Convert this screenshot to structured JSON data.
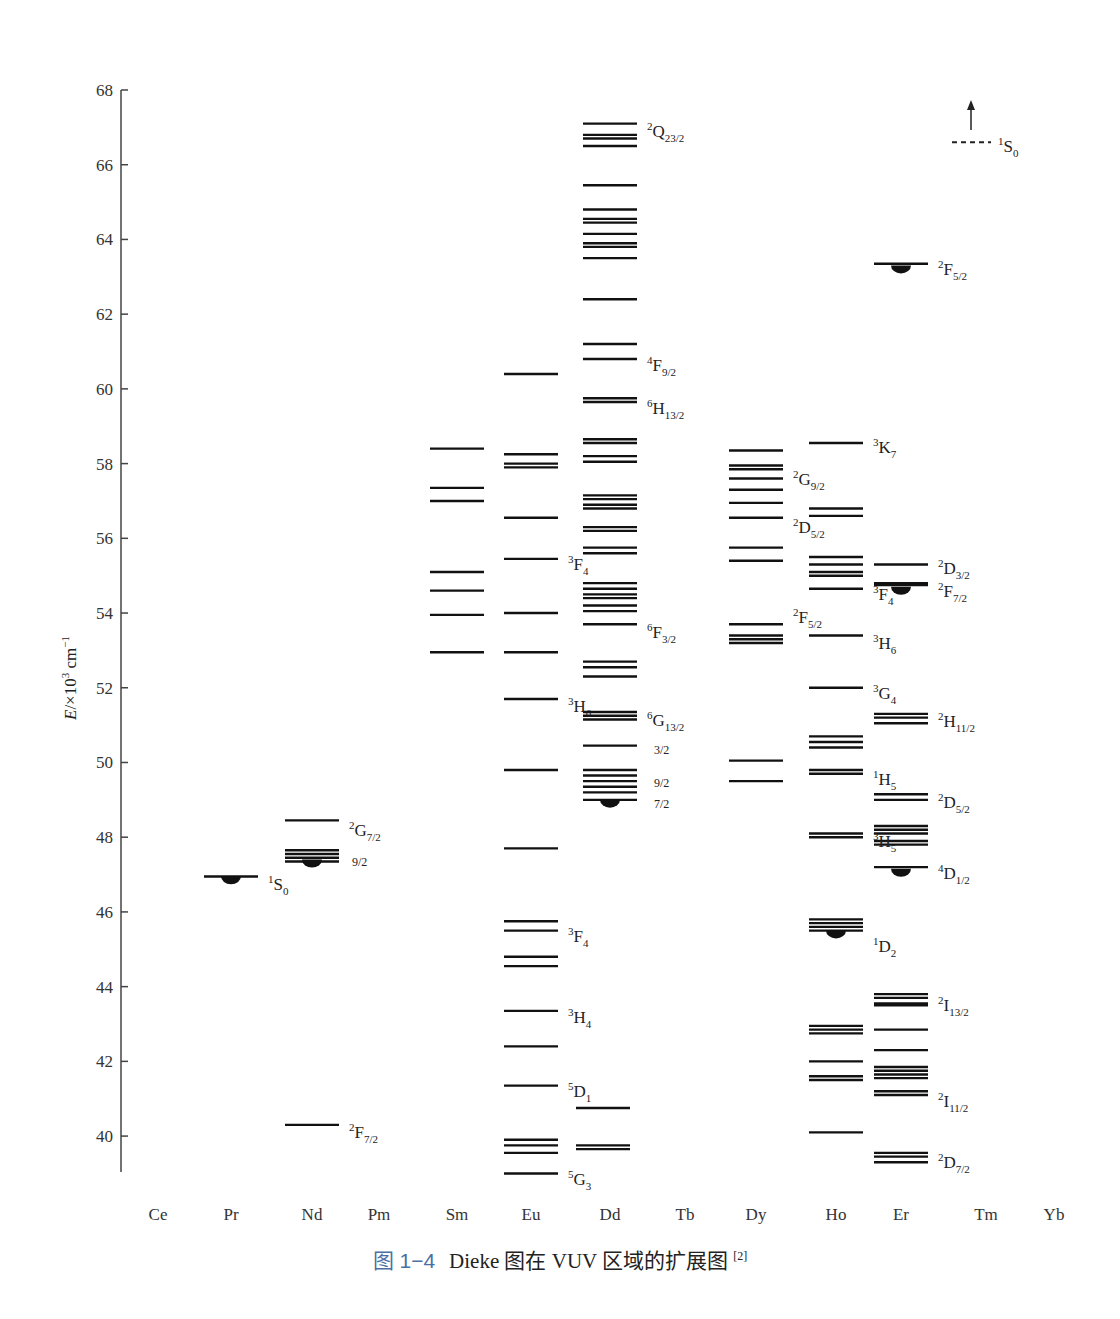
{
  "chart_data": {
    "type": "energy-level-diagram",
    "title": "",
    "ylabel": "E/×10³ cm⁻¹",
    "xlabel": "",
    "ylim": [
      39,
      68
    ],
    "yticks": [
      40,
      42,
      44,
      46,
      48,
      50,
      52,
      54,
      56,
      58,
      60,
      62,
      64,
      66,
      68
    ],
    "grid": false,
    "categories": [
      "Ce",
      "Pr",
      "Nd",
      "Pm",
      "Sm",
      "Eu",
      "Dd",
      "Tb",
      "Dy",
      "Ho",
      "Er",
      "Tm",
      "Yb"
    ],
    "category_x": [
      158,
      231,
      312,
      379,
      457,
      531,
      610,
      685,
      756,
      836,
      901,
      986,
      1054
    ],
    "series": [
      {
        "name": "Ce",
        "levels": []
      },
      {
        "name": "Pr",
        "levels": [
          46.95
        ],
        "bulbs": [
          46.9
        ],
        "labels": [
          {
            "text": "1S0",
            "sup": "1",
            "main": "S",
            "sub": "0",
            "E": 46.75
          }
        ]
      },
      {
        "name": "Nd",
        "levels": [
          48.45,
          47.65,
          47.55,
          47.45,
          47.35,
          40.3
        ],
        "bulbs": [
          47.35
        ],
        "labels": [
          {
            "text": "2G7/2",
            "sup": "2",
            "main": "G",
            "sub": "7/2",
            "E": 48.2
          },
          {
            "text": "9/2",
            "plain": "9/2",
            "E": 47.4,
            "dx": 40
          },
          {
            "text": "2F7/2",
            "sup": "2",
            "main": "F",
            "sub": "7/2",
            "E": 40.1
          }
        ]
      },
      {
        "name": "Pm",
        "levels": []
      },
      {
        "name": "Sm",
        "levels": [
          58.4,
          57.35,
          57.0,
          55.1,
          54.6,
          53.95,
          52.95
        ],
        "labels": []
      },
      {
        "name": "Eu",
        "levels": [
          60.4,
          58.25,
          58.0,
          57.9,
          56.55,
          55.45,
          54.0,
          52.95,
          51.7,
          49.8,
          47.7,
          45.75,
          45.5,
          44.8,
          44.55,
          43.35,
          42.4,
          41.35,
          39.9,
          39.75,
          39.55,
          39.0
        ],
        "labels": [
          {
            "text": "3F4",
            "sup": "3",
            "main": "F",
            "sub": "4",
            "E": 55.3
          },
          {
            "text": "3H6",
            "sup": "3",
            "main": "H",
            "sub": "6",
            "E": 51.5
          },
          {
            "text": "3F4",
            "sup": "3",
            "main": "F",
            "sub": "4",
            "E": 45.35
          },
          {
            "text": "3H4",
            "sup": "3",
            "main": "H",
            "sub": "4",
            "E": 43.2
          },
          {
            "text": "5D1",
            "sup": "5",
            "main": "D",
            "sub": "1",
            "E": 41.2
          },
          {
            "text": "5G3",
            "sup": "5",
            "main": "G",
            "sub": "3",
            "E": 38.85
          }
        ]
      },
      {
        "name": "Dd",
        "levels": [
          67.1,
          66.8,
          66.7,
          66.5,
          65.45,
          64.8,
          64.55,
          64.45,
          64.15,
          63.9,
          63.8,
          63.5,
          62.4,
          61.2,
          60.8,
          59.75,
          59.65,
          58.65,
          58.55,
          58.2,
          58.05,
          57.15,
          57.05,
          56.9,
          56.8,
          56.3,
          56.2,
          55.75,
          55.6,
          54.8,
          54.65,
          54.5,
          54.4,
          54.2,
          54.05,
          53.7,
          52.7,
          52.55,
          52.3,
          51.35,
          51.25,
          51.15,
          50.45,
          49.8,
          49.65,
          49.5,
          49.35,
          49.2,
          49.0
        ],
        "bulbs": [
          48.95
        ],
        "labels": [
          {
            "text": "2Q23/2",
            "sup": "2",
            "main": "Q",
            "sub": "23/2",
            "E": 66.9
          },
          {
            "text": "4F9/2",
            "sup": "4",
            "main": "F",
            "sub": "9/2",
            "E": 60.65
          },
          {
            "text": "6H13/2",
            "sup": "6",
            "main": "H",
            "sub": "13/2",
            "E": 59.5
          },
          {
            "text": "6F3/2",
            "sup": "6",
            "main": "F",
            "sub": "3/2",
            "E": 53.5
          },
          {
            "text": "6G13/2",
            "sup": "6",
            "main": "G",
            "sub": "13/2",
            "E": 51.15
          },
          {
            "text": "3/2",
            "plain": "3/2",
            "E": 50.4,
            "dx": 44
          },
          {
            "text": "9/2",
            "plain": "9/2",
            "E": 49.5,
            "dx": 44
          },
          {
            "text": "7/2",
            "plain": "7/2",
            "E": 48.95,
            "dx": 44
          }
        ]
      },
      {
        "name": "Dd-low",
        "x": 603,
        "levels": [
          40.75,
          39.75,
          39.65
        ],
        "labels": []
      },
      {
        "name": "Tb",
        "levels": []
      },
      {
        "name": "Dy",
        "levels": [
          58.35,
          57.95,
          57.85,
          57.6,
          57.3,
          56.95,
          56.55,
          55.75,
          55.4,
          53.7,
          53.4,
          53.3,
          53.2,
          50.05,
          49.5
        ],
        "labels": [
          {
            "text": "2G9/2",
            "sup": "2",
            "main": "G",
            "sub": "9/2",
            "E": 57.6
          },
          {
            "text": "2D5/2",
            "sup": "2",
            "main": "D",
            "sub": "5/2",
            "E": 56.3
          },
          {
            "text": "2F5/2",
            "sup": "2",
            "main": "F",
            "sub": "5/2",
            "E": 53.9
          }
        ]
      },
      {
        "name": "Ho",
        "levels": [
          58.55,
          56.8,
          56.6,
          55.5,
          55.3,
          55.1,
          55.0,
          54.65,
          53.4,
          52.0,
          50.7,
          50.55,
          50.4,
          49.8,
          49.7,
          48.1,
          48.0,
          45.8,
          45.7,
          45.6,
          45.5,
          42.95,
          42.85,
          42.75,
          42.0,
          41.6,
          41.5,
          40.1
        ],
        "bulbs": [
          45.45
        ],
        "labels": [
          {
            "text": "3K7",
            "sup": "3",
            "main": "K",
            "sub": "7",
            "E": 58.45
          },
          {
            "text": "3F4",
            "sup": "3",
            "main": "F",
            "sub": "4",
            "E": 54.5
          },
          {
            "text": "3H6",
            "sup": "3",
            "main": "H",
            "sub": "6",
            "E": 53.2
          },
          {
            "text": "3G4",
            "sup": "3",
            "main": "G",
            "sub": "4",
            "E": 51.85
          },
          {
            "text": "1H5",
            "sup": "1",
            "main": "H",
            "sub": "5",
            "E": 49.55
          },
          {
            "text": "3H5",
            "sup": "3",
            "main": "H",
            "sub": "5",
            "E": 47.9
          },
          {
            "text": "1D2",
            "sup": "1",
            "main": "D",
            "sub": "2",
            "E": 45.1
          }
        ]
      },
      {
        "name": "Er",
        "levels": [
          63.35,
          55.3,
          54.8,
          54.75,
          51.3,
          51.2,
          51.05,
          49.15,
          49.0,
          48.3,
          48.2,
          48.1,
          47.9,
          47.8,
          47.2,
          43.8,
          43.7,
          43.55,
          43.5,
          42.85,
          42.3,
          41.85,
          41.75,
          41.65,
          41.55,
          41.2,
          41.1,
          39.55,
          39.45,
          39.3
        ],
        "bulbs": [
          63.25,
          54.65,
          47.1
        ],
        "labels": [
          {
            "text": "2F5/2",
            "sup": "2",
            "main": "F",
            "sub": "5/2",
            "E": 63.2
          },
          {
            "text": "2D3/2",
            "sup": "2",
            "main": "D",
            "sub": "3/2",
            "E": 55.2
          },
          {
            "text": "2F7/2",
            "sup": "2",
            "main": "F",
            "sub": "7/2",
            "E": 54.6
          },
          {
            "text": "2H11/2",
            "sup": "2",
            "main": "H",
            "sub": "11/2",
            "E": 51.1
          },
          {
            "text": "2D5/2",
            "sup": "2",
            "main": "D",
            "sub": "5/2",
            "E": 48.95
          },
          {
            "text": "4D1/2",
            "sup": "4",
            "main": "D",
            "sub": "1/2",
            "E": 47.05
          },
          {
            "text": "2I13/2",
            "sup": "2",
            "main": "I",
            "sub": "13/2",
            "E": 43.5
          },
          {
            "text": "2I11/2",
            "sup": "2",
            "main": "I",
            "sub": "11/2",
            "E": 40.95
          },
          {
            "text": "2D7/2",
            "sup": "2",
            "main": "D",
            "sub": "7/2",
            "E": 39.3
          }
        ]
      },
      {
        "name": "Tm",
        "levels": [],
        "dashed_levels": [
          66.6
        ],
        "arrow_up": true,
        "labels": [
          {
            "text": "1S0",
            "sup": "1",
            "main": "S",
            "sub": "0",
            "E": 66.5
          }
        ]
      },
      {
        "name": "Yb",
        "levels": []
      }
    ]
  },
  "axis": {
    "ylabel_italic": "E",
    "ylabel_rest": "/×10",
    "ylabel_exp": "3",
    "ylabel_unit": " cm",
    "ylabel_unit_exp": "−1"
  },
  "caption": {
    "figure_number": "图 1−4",
    "text": "Dieke 图在 VUV 区域的扩展图",
    "ref": "[2]"
  }
}
